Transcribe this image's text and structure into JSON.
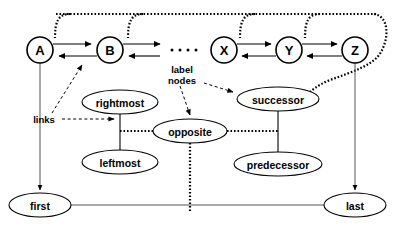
{
  "diagram": {
    "colors": {
      "stroke": "#000000",
      "background": "#ffffff",
      "thin_stroke": "#555555"
    },
    "element_nodes": [
      {
        "id": "A",
        "label": "A",
        "cx": 40,
        "cy": 50,
        "r": 13
      },
      {
        "id": "B",
        "label": "B",
        "cx": 110,
        "cy": 50,
        "r": 13
      },
      {
        "id": "X",
        "label": "X",
        "cx": 224,
        "cy": 50,
        "r": 13
      },
      {
        "id": "Y",
        "label": "Y",
        "cx": 289,
        "cy": 50,
        "r": 13
      },
      {
        "id": "Z",
        "label": "Z",
        "cx": 355,
        "cy": 50,
        "r": 13
      }
    ],
    "ellipsis": {
      "label": "....",
      "dot_count": 4,
      "cx": 180,
      "cy": 50
    },
    "label_nodes": [
      {
        "id": "rightmost",
        "label": "rightmost",
        "cx": 120,
        "cy": 102,
        "rx": 38,
        "ry": 12
      },
      {
        "id": "leftmost",
        "label": "leftmost",
        "cx": 120,
        "cy": 162,
        "rx": 38,
        "ry": 12
      },
      {
        "id": "opposite",
        "label": "opposite",
        "cx": 190,
        "cy": 131,
        "rx": 37,
        "ry": 12
      },
      {
        "id": "successor",
        "label": "successor",
        "cx": 278,
        "cy": 99,
        "rx": 41,
        "ry": 12
      },
      {
        "id": "predecessor",
        "label": "predecessor",
        "cx": 278,
        "cy": 164,
        "rx": 44,
        "ry": 12
      },
      {
        "id": "first",
        "label": "first",
        "cx": 40,
        "cy": 205,
        "rx": 31,
        "ry": 12
      },
      {
        "id": "last",
        "label": "last",
        "cx": 355,
        "cy": 205,
        "rx": 31,
        "ry": 12
      }
    ],
    "annotations": [
      {
        "id": "links",
        "label": "links",
        "x": 44,
        "y": 119
      },
      {
        "id": "label-nodes",
        "line1": "label",
        "line2": "nodes",
        "x": 182,
        "y": 74
      }
    ],
    "edge_kinds": {
      "solid_arrow": "next/previous pointer",
      "dotted": "opposite / label-node link",
      "dashed": "annotation callout"
    }
  }
}
